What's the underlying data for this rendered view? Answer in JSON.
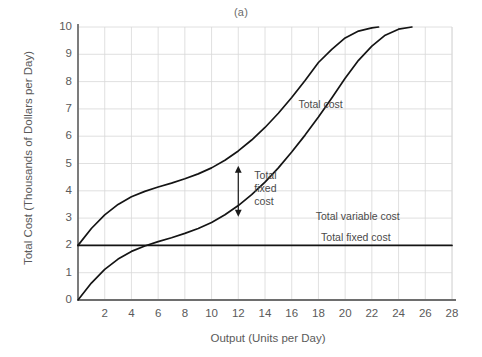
{
  "chart_data": {
    "type": "line",
    "title": "(a)",
    "xlabel": "Output (Units per Day)",
    "ylabel": "Total Cost (Thousands of Dollars per Day)",
    "xlim": [
      0,
      28
    ],
    "ylim": [
      0,
      10
    ],
    "xticks": [
      2,
      4,
      6,
      8,
      10,
      12,
      14,
      16,
      18,
      20,
      22,
      24,
      26,
      28
    ],
    "yticks": [
      0,
      1,
      2,
      3,
      4,
      5,
      6,
      7,
      8,
      9,
      10
    ],
    "grid": true,
    "grid_color": "#d8d8d8",
    "legend_position": "inline-annotations",
    "line_color": "#141414",
    "series": [
      {
        "name": "Total cost",
        "label": "Total cost",
        "label_x": 16.5,
        "label_y": 7.15,
        "x": [
          0,
          1,
          2,
          3,
          4,
          5,
          6,
          7,
          8,
          9,
          10,
          11,
          12,
          13,
          14,
          15,
          16,
          17,
          18,
          19,
          20,
          21,
          22,
          22.5
        ],
        "y": [
          2.0,
          2.62,
          3.12,
          3.5,
          3.78,
          3.98,
          4.14,
          4.28,
          4.44,
          4.62,
          4.84,
          5.12,
          5.46,
          5.86,
          6.32,
          6.84,
          7.42,
          8.04,
          8.7,
          9.18,
          9.6,
          9.85,
          9.97,
          10.0
        ]
      },
      {
        "name": "Total variable cost",
        "label": "Total variable cost",
        "label_x": 17.8,
        "label_y": 3.05,
        "x": [
          0,
          1,
          2,
          3,
          4,
          5,
          6,
          7,
          8,
          9,
          10,
          11,
          12,
          13,
          14,
          15,
          16,
          17,
          18,
          19,
          20,
          21,
          22,
          23,
          24,
          25
        ],
        "y": [
          0.0,
          0.62,
          1.12,
          1.5,
          1.78,
          1.98,
          2.14,
          2.28,
          2.44,
          2.62,
          2.84,
          3.12,
          3.46,
          3.86,
          4.32,
          4.84,
          5.42,
          6.04,
          6.7,
          7.4,
          8.12,
          8.78,
          9.3,
          9.7,
          9.92,
          10.0
        ]
      },
      {
        "name": "Total fixed cost",
        "label": "Total fixed cost",
        "label_x": 18.2,
        "label_y": 2.28,
        "x": [
          0,
          28
        ],
        "y": [
          2.0,
          2.0
        ]
      }
    ],
    "annotations": [
      {
        "name": "total-fixed-cost-gap-arrow",
        "type": "double-arrow",
        "x": 12,
        "y_from": 3.05,
        "y_to": 4.92,
        "label": "Total fixed cost",
        "label_lines": [
          "Total",
          "fixed",
          "cost"
        ],
        "label_x": 13.2,
        "label_y": 4.55
      }
    ]
  }
}
